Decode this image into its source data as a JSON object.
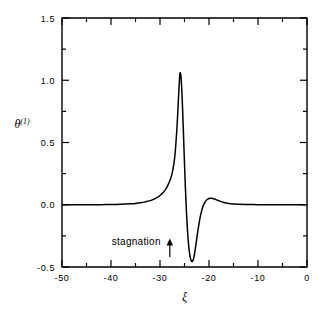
{
  "figure": {
    "background_color": "#ffffff",
    "line_color": "#000000",
    "annotation": {
      "text": "stagnation",
      "arrow_icon": "up-arrow-icon",
      "arrow_x_value": -28
    },
    "y_axis": {
      "label": "θ",
      "label_superscript": "(1)",
      "tick_labels": [
        "1.5",
        "1.0",
        "0.5",
        "0.0",
        "-0.5"
      ],
      "tick_values": [
        1.5,
        1.0,
        0.5,
        0.0,
        -0.5
      ],
      "minor_tick_values": [
        1.25,
        0.75,
        0.25,
        -0.25
      ]
    },
    "x_axis": {
      "label": "ξ",
      "tick_labels": [
        "-50",
        "-40",
        "-30",
        "-20",
        "-10",
        "0"
      ],
      "tick_values": [
        -50,
        -40,
        -30,
        -20,
        -10,
        0
      ],
      "minor_tick_values": [
        -45,
        -35,
        -25,
        -15,
        -5
      ]
    }
  },
  "chart_data": {
    "type": "line",
    "title": "",
    "xlabel": "ξ",
    "ylabel": "θ^(1)",
    "xlim": [
      -50,
      0
    ],
    "ylim": [
      -0.5,
      1.5
    ],
    "grid": false,
    "legend": null,
    "xticks": [
      -50,
      -40,
      -30,
      -20,
      -10,
      0
    ],
    "yticks": [
      -0.5,
      0.0,
      0.5,
      1.0,
      1.5
    ],
    "annotations": [
      {
        "text": "stagnation",
        "x": -28,
        "y": -0.28,
        "arrow_to": {
          "x": -28,
          "y": -0.42
        }
      }
    ],
    "series": [
      {
        "name": "theta^(1)",
        "x": [
          -50.0,
          -48.0,
          -46.0,
          -44.0,
          -42.0,
          -40.0,
          -38.0,
          -36.0,
          -35.0,
          -34.0,
          -33.0,
          -32.0,
          -31.0,
          -30.5,
          -30.0,
          -29.5,
          -29.0,
          -28.5,
          -28.0,
          -27.6,
          -27.2,
          -26.9,
          -26.6,
          -26.4,
          -26.2,
          -26.05,
          -25.95,
          -25.85,
          -25.7,
          -25.55,
          -25.4,
          -25.2,
          -25.0,
          -24.8,
          -24.6,
          -24.4,
          -24.2,
          -24.0,
          -23.8,
          -23.6,
          -23.4,
          -23.2,
          -23.0,
          -22.7,
          -22.4,
          -22.1,
          -21.8,
          -21.5,
          -21.2,
          -20.9,
          -20.5,
          -20.0,
          -19.5,
          -19.0,
          -18.5,
          -18.0,
          -17.0,
          -16.0,
          -14.0,
          -12.0,
          -10.0,
          -8.0,
          -6.0,
          -4.0,
          -2.0,
          0.0
        ],
        "y": [
          0.0,
          0.0,
          0.0,
          0.001,
          0.001,
          0.002,
          0.004,
          0.008,
          0.011,
          0.016,
          0.023,
          0.033,
          0.049,
          0.06,
          0.074,
          0.092,
          0.116,
          0.148,
          0.192,
          0.24,
          0.32,
          0.42,
          0.58,
          0.72,
          0.88,
          0.99,
          1.045,
          1.06,
          1.02,
          0.92,
          0.78,
          0.56,
          0.33,
          0.12,
          -0.06,
          -0.2,
          -0.305,
          -0.38,
          -0.428,
          -0.45,
          -0.455,
          -0.44,
          -0.405,
          -0.33,
          -0.245,
          -0.165,
          -0.1,
          -0.048,
          -0.01,
          0.016,
          0.038,
          0.05,
          0.052,
          0.048,
          0.04,
          0.032,
          0.018,
          0.01,
          0.004,
          0.002,
          0.001,
          0.001,
          0.0,
          0.0,
          0.0,
          0.0
        ]
      }
    ]
  }
}
